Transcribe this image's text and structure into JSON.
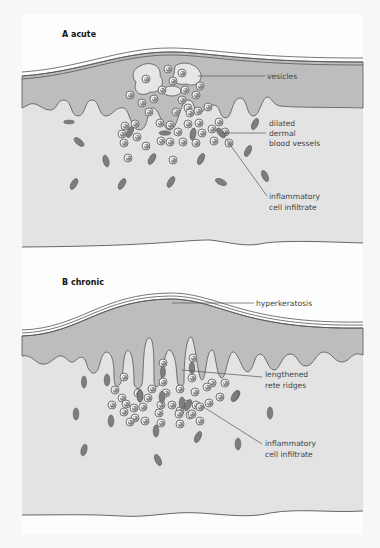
{
  "figure": {
    "panels": [
      {
        "id": "A",
        "title": "A acute",
        "labels": {
          "vesicles": "vesicles",
          "vessels": [
            "dilated",
            "dermal",
            "blood vessels"
          ],
          "infiltrate": [
            "inflammatory",
            "cell infiltrate"
          ]
        }
      },
      {
        "id": "B",
        "title": "B chronic",
        "labels": {
          "hyperkeratosis": "hyperkeratosis",
          "rete": [
            "lengthened",
            "rete ridges"
          ],
          "infiltrate": [
            "inflammatory",
            "cell infiltrate"
          ]
        }
      }
    ],
    "colors": {
      "background": "#fdfdfd",
      "epidermis": "#bdbdbd",
      "dermis": "#e3e3e3",
      "outline": "#555555",
      "vessel": "#7e7e7e",
      "cell_fill": "#f2f2f2",
      "nucleus": "#8a8a8a",
      "text": "#444444"
    }
  }
}
